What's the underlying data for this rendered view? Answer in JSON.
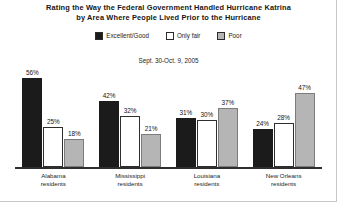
{
  "chart": {
    "title_line1": "Rating the Way the Federal Government Handled Hurricane Katrina",
    "title_line2": "by Area Where People Lived Prior to the Hurricane",
    "subtitle": "Sept. 30-Oct. 9, 2005"
  },
  "legend": {
    "items": [
      {
        "label": "Excellent/Good",
        "swatch": "black-swatch-icon",
        "color": "#1b1b1b"
      },
      {
        "label": "Only fair",
        "swatch": "white-swatch-icon",
        "color": "#ffffff"
      },
      {
        "label": "Poor",
        "swatch": "gray-swatch-icon",
        "color": "#b5b5b5"
      }
    ]
  },
  "chart_data": {
    "type": "bar",
    "title": "Rating the Way the Federal Government Handled Hurricane Katrina by Area Where People Lived Prior to the Hurricane",
    "subtitle": "Sept. 30-Oct. 9, 2005",
    "xlabel": "",
    "ylabel": "",
    "ylim": [
      0,
      60
    ],
    "grid": false,
    "legend_position": "top-center",
    "categories": [
      "Alabama residents",
      "Mississippi residents",
      "Louisiana residents",
      "New Orleans residents"
    ],
    "category_lines": [
      [
        "Alabama",
        "residents"
      ],
      [
        "Mississippi",
        "residents"
      ],
      [
        "Louisiana",
        "residents"
      ],
      [
        "New Orleans",
        "residents"
      ]
    ],
    "series": [
      {
        "name": "Excellent/Good",
        "color": "#1b1b1b",
        "values": [
          56,
          42,
          31,
          24
        ],
        "labels": [
          "56%",
          "42%",
          "31%",
          "24%"
        ]
      },
      {
        "name": "Only fair",
        "color": "#ffffff",
        "values": [
          25,
          32,
          30,
          28
        ],
        "labels": [
          "25%",
          "32%",
          "30%",
          "28%"
        ]
      },
      {
        "name": "Poor",
        "color": "#b5b5b5",
        "values": [
          18,
          21,
          37,
          47
        ],
        "labels": [
          "18%",
          "21%",
          "37%",
          "47%"
        ]
      }
    ]
  }
}
